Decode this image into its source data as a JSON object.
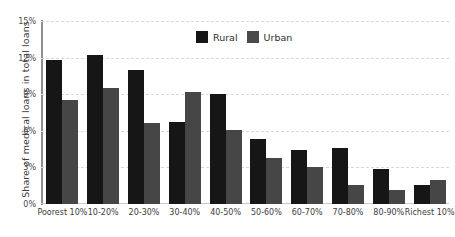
{
  "chart_data": {
    "type": "bar",
    "title": "",
    "xlabel": "",
    "ylabel": "Share of medical loans in total loans",
    "ylim": [
      0,
      15
    ],
    "yticks": [
      "0%",
      "3%",
      "6%",
      "9%",
      "12%",
      "15%"
    ],
    "ytick_values": [
      0,
      3,
      6,
      9,
      12,
      15
    ],
    "grid": true,
    "legend_position": "top-center",
    "categories": [
      "Poorest 10%",
      "10-20%",
      "20-30%",
      "30-40%",
      "40-50%",
      "50-60%",
      "60-70%",
      "70-80%",
      "80-90%",
      "Richest 10%"
    ],
    "series": [
      {
        "name": "Rural",
        "color": "#161616",
        "values": [
          11.8,
          12.2,
          11.0,
          6.7,
          9.0,
          5.3,
          4.4,
          4.6,
          2.9,
          1.55
        ]
      },
      {
        "name": "Urban",
        "color": "#464646",
        "values": [
          8.5,
          9.5,
          6.6,
          9.2,
          6.1,
          3.75,
          3.0,
          1.55,
          1.15,
          1.95
        ]
      }
    ]
  }
}
